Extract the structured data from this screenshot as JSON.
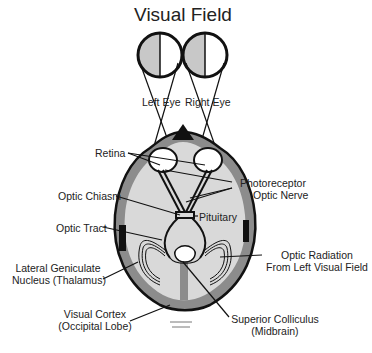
{
  "title": "Visual Field",
  "eyes": {
    "left": "Left Eye",
    "right": "Right Eye"
  },
  "labels": {
    "retina": "Retina",
    "photoreceptor": "Photoreceptor",
    "optic_nerve": "Optic Nerve",
    "optic_chiasm": "Optic Chiasm",
    "pituitary": "Pituitary",
    "optic_tract": "Optic Tract",
    "optic_radiation_1": "Optic Radiation",
    "optic_radiation_2": "From Left Visual Field",
    "lgn_1": "Lateral Geniculate",
    "lgn_2": "Nucleus (Thalamus)",
    "visual_cortex_1": "Visual Cortex",
    "visual_cortex_2": "(Occipital Lobe)",
    "superior_colliculus_1": "Superior Colliculus",
    "superior_colliculus_2": "(Midbrain)"
  },
  "colors": {
    "ink": "#111111",
    "brain_fill": "#d9d9d9",
    "cortex_band": "#8c8c8c",
    "field_shade": "#c8c8c8"
  }
}
